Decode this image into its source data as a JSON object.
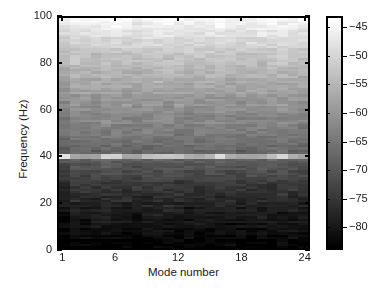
{
  "chart_data": {
    "type": "heatmap",
    "title": "",
    "xlabel": "Mode number",
    "ylabel": "Frequency (Hz)",
    "xlim": [
      0.5,
      24.5
    ],
    "ylim": [
      0,
      100
    ],
    "xticks": [
      1,
      6,
      12,
      18,
      24
    ],
    "xtick_labels": [
      "1",
      "6",
      "12",
      "18",
      "24"
    ],
    "yticks": [
      0,
      20,
      40,
      60,
      80,
      100
    ],
    "ytick_labels": [
      "0",
      "20",
      "40",
      "60",
      "80",
      "100"
    ],
    "grid": false,
    "colormap": "gray",
    "n_modes": 24,
    "n_freq_bins": 100,
    "colorbar": {
      "label": "",
      "vmin": -84,
      "vmax": -43,
      "ticks": [
        -45,
        -50,
        -55,
        -60,
        -65,
        -70,
        -75,
        -80
      ],
      "tick_labels": [
        "−45",
        "−50",
        "−55",
        "−60",
        "−65",
        "−70",
        "−75",
        "−80"
      ],
      "orientation": "vertical",
      "position": "right"
    },
    "annotations": [
      "Bright horizontal band at 60 Hz (power-line interference) spanning all modes, strongest at modes 1, 5-6, 9-12, 16, 22",
      "Broad bright (high power) region below ~45 Hz, brightest 0-10 Hz",
      "Dark (low power) region above ~70 Hz",
      "Mode 1 column slightly darker/narrower than remaining modes"
    ],
    "mode_level_offsets_db": [
      -1.6,
      0.2,
      0.1,
      -0.1,
      0.5,
      0.4,
      0.0,
      -0.2,
      0.3,
      0.6,
      0.5,
      0.3,
      -0.1,
      0.1,
      0.4,
      0.5,
      0.2,
      -0.2,
      0.1,
      0.3,
      0.5,
      0.6,
      0.2,
      0.0
    ],
    "mean_spectrum_db": [
      -45.0,
      -45.3,
      -45.8,
      -46.3,
      -46.9,
      -47.4,
      -47.9,
      -48.4,
      -48.9,
      -49.4,
      -49.9,
      -50.4,
      -50.9,
      -51.4,
      -51.8,
      -52.2,
      -52.6,
      -53.0,
      -53.4,
      -53.8,
      -54.2,
      -54.6,
      -55.0,
      -55.4,
      -55.8,
      -56.2,
      -56.6,
      -57.0,
      -57.4,
      -57.8,
      -58.2,
      -58.6,
      -59.0,
      -59.4,
      -59.8,
      -60.1,
      -60.4,
      -60.7,
      -61.0,
      -61.3,
      -61.6,
      -61.9,
      -62.2,
      -62.5,
      -62.8,
      -63.1,
      -63.4,
      -63.7,
      -64.0,
      -64.3,
      -64.7,
      -65.1,
      -65.5,
      -65.9,
      -66.3,
      -66.7,
      -67.1,
      -67.5,
      -67.9,
      -55.0,
      -68.8,
      -69.3,
      -69.8,
      -70.3,
      -70.8,
      -71.3,
      -71.8,
      -72.3,
      -72.8,
      -73.3,
      -73.8,
      -74.3,
      -74.8,
      -75.3,
      -75.8,
      -76.2,
      -76.6,
      -77.0,
      -77.4,
      -77.8,
      -78.2,
      -78.6,
      -79.0,
      -79.4,
      -79.8,
      -80.1,
      -80.4,
      -80.7,
      -81.0,
      -81.3,
      -81.6,
      -81.9,
      -82.2,
      -82.5,
      -82.8,
      -83.0,
      -83.2,
      -83.4,
      -83.6,
      -83.8
    ],
    "line_60hz_mode_intensity_db": [
      -47.5,
      -57.0,
      -58.5,
      -58.0,
      -50.0,
      -50.5,
      -57.5,
      -58.0,
      -53.0,
      -52.5,
      -52.0,
      -52.5,
      -56.5,
      -57.0,
      -55.0,
      -48.5,
      -56.0,
      -57.5,
      -58.0,
      -57.0,
      -53.5,
      -50.0,
      -56.5,
      -57.5
    ]
  },
  "axes": {
    "x_title": "Mode number",
    "y_title": "Frequency (Hz)"
  }
}
